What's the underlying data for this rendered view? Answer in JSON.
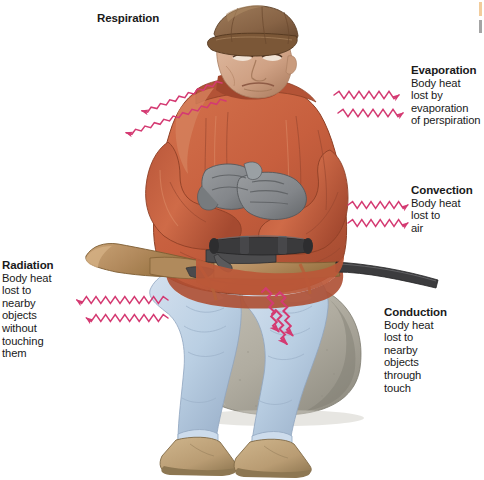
{
  "figure": {
    "arrow_color": "#d43a72",
    "background_color": "#ffffff"
  },
  "labels": {
    "respiration": {
      "heading": "Respiration",
      "body": "",
      "arrow_direction": "up-left",
      "arrow_count": 2
    },
    "evaporation": {
      "heading": "Evaporation",
      "line1": "Body heat",
      "line2": "lost by",
      "line3": "evaporation",
      "line4": "of perspiration",
      "arrow_direction": "right",
      "arrow_count": 2
    },
    "convection": {
      "heading": "Convection",
      "line1": "Body heat",
      "line2": "lost to",
      "line3": "air",
      "arrow_direction": "right",
      "arrow_count": 2
    },
    "conduction": {
      "heading": "Conduction",
      "line1": "Body heat",
      "line2": "lost to",
      "line3": "nearby",
      "line4": "objects",
      "line5": "through",
      "line6": "touch",
      "arrow_direction": "down-right",
      "arrow_count": 3
    },
    "radiation": {
      "heading": "Radiation",
      "line1": "Body heat",
      "line2": "lost to",
      "line3": "nearby",
      "line4": "objects",
      "line5": "without",
      "line6": "touching",
      "line7": "them",
      "arrow_direction": "left",
      "arrow_count": 2
    }
  },
  "palette": {
    "parka": "#c9603f",
    "parka_shadow": "#9c4630",
    "parka_light": "#d97a56",
    "cap": "#8e6b4e",
    "cap_dark": "#6b4b33",
    "skin": "#d9b096",
    "skin_shadow": "#b5886c",
    "glove": "#8a8d90",
    "glove_dark": "#6a6d70",
    "jeans": "#c2d3e6",
    "jeans_shadow": "#9fb4cc",
    "boot": "#c2a77e",
    "boot_dark": "#9b8360",
    "rock": "#b6b2a8",
    "rock_dark": "#928e83",
    "rifle_wood": "#b99367",
    "rifle_metal": "#3b3b3d",
    "arrow": "#d43a72"
  }
}
